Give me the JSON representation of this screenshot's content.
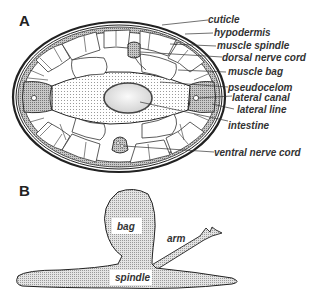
{
  "figure": {
    "panels": [
      {
        "id": "A",
        "label": "A"
      },
      {
        "id": "B",
        "label": "B"
      }
    ],
    "panel_a": {
      "labels": [
        {
          "text": "cuticle"
        },
        {
          "text": "hypodermis"
        },
        {
          "text": "muscle spindle"
        },
        {
          "text": "dorsal nerve cord"
        },
        {
          "text": "muscle bag"
        },
        {
          "text": "pseudocelom"
        },
        {
          "text": "lateral canal"
        },
        {
          "text": "lateral line"
        },
        {
          "text": "intestine"
        },
        {
          "text": "ventral nerve cord"
        }
      ]
    },
    "panel_b": {
      "labels": [
        {
          "text": "bag"
        },
        {
          "text": "arm"
        },
        {
          "text": "spindle"
        }
      ]
    },
    "colors": {
      "line": "#222222",
      "stipple": "#bdbdbd",
      "hypodermis": "#9a9a9a",
      "background": "#ffffff"
    }
  }
}
